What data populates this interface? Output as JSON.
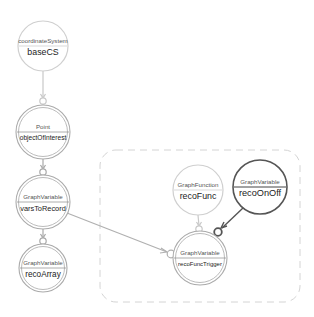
{
  "diagram": {
    "colors": {
      "light_stroke": "#c8c8c8",
      "mid_stroke": "#a8a8a8",
      "dark_stroke": "#555555",
      "group_border": "#d0d0d0",
      "background": "#ffffff"
    },
    "nodes": [
      {
        "id": "baseCS",
        "type": "coordinateSystem",
        "name": "baseCS",
        "cx": 43,
        "cy": 46,
        "r": 25,
        "style": "light"
      },
      {
        "id": "objectOfInterest",
        "type": "Point",
        "name": "objectOfInterest",
        "cx": 43,
        "cy": 132,
        "r": 27,
        "style": "double"
      },
      {
        "id": "varsToRecord",
        "type": "GraphVariable",
        "name": "varsToRecord",
        "cx": 43,
        "cy": 202,
        "r": 27,
        "style": "double"
      },
      {
        "id": "recoArray",
        "type": "GraphVariable",
        "name": "recoArray",
        "cx": 43,
        "cy": 268,
        "r": 24,
        "style": "double"
      },
      {
        "id": "recoFunc",
        "type": "GraphFunction",
        "name": "recoFunc",
        "cx": 198,
        "cy": 190,
        "r": 25,
        "style": "light"
      },
      {
        "id": "recoOnOff",
        "type": "GraphVariable",
        "name": "recoOnOff",
        "cx": 260,
        "cy": 187,
        "r": 27,
        "style": "dark"
      },
      {
        "id": "recoFuncTrigger",
        "type": "GraphVariable",
        "name": "recoFuncTrigger",
        "cx": 200,
        "cy": 258,
        "r": 27,
        "style": "double"
      }
    ],
    "edges": [
      {
        "from": "baseCS",
        "to": "objectOfInterest"
      },
      {
        "from": "objectOfInterest",
        "to": "varsToRecord"
      },
      {
        "from": "varsToRecord",
        "to": "recoArray"
      },
      {
        "from": "varsToRecord",
        "to": "recoFuncTrigger"
      },
      {
        "from": "recoFunc",
        "to": "recoFuncTrigger"
      },
      {
        "from": "recoOnOff",
        "to": "recoFuncTrigger"
      }
    ],
    "group": {
      "label": "",
      "x": 100,
      "y": 150,
      "width": 200,
      "height": 152,
      "rx": 16
    }
  }
}
